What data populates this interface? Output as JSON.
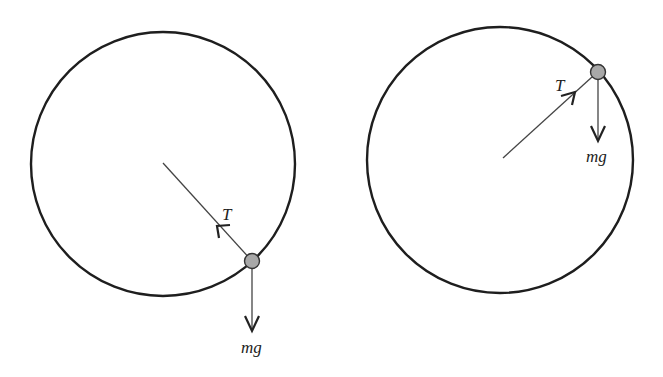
{
  "figure": {
    "colors": {
      "background": "#ffffff",
      "circle_stroke": "#1e1e1e",
      "vector_stroke": "#444444",
      "mass_fill": "#a8a8a8",
      "mass_stroke": "#333333",
      "label": "#222222"
    },
    "diagrams": [
      {
        "id": "lower-position",
        "circle": {
          "cx": 163,
          "cy": 164,
          "r": 132
        },
        "mass": {
          "cx": 252,
          "cy": 261,
          "r": 7.5
        },
        "tension": {
          "label": "T",
          "from": [
            252,
            261
          ],
          "to": [
            163,
            163
          ],
          "arrowhead_at": [
            217,
            226
          ],
          "label_pos": [
            222,
            220
          ]
        },
        "weight": {
          "label": "mg",
          "from": [
            252,
            269
          ],
          "to": [
            252,
            330
          ],
          "label_pos": [
            241,
            353
          ]
        }
      },
      {
        "id": "upper-position",
        "circle": {
          "cx": 500,
          "cy": 160,
          "r": 133
        },
        "mass": {
          "cx": 598,
          "cy": 72,
          "r": 7.5
        },
        "tension": {
          "label": "T",
          "from": [
            503,
            158
          ],
          "to": [
            591,
            78
          ],
          "arrowhead_at": [
            575,
            92
          ],
          "label_pos": [
            555,
            91
          ]
        },
        "weight": {
          "label": "mg",
          "from": [
            598,
            80
          ],
          "to": [
            598,
            141
          ],
          "label_pos": [
            586,
            162
          ]
        }
      }
    ]
  }
}
